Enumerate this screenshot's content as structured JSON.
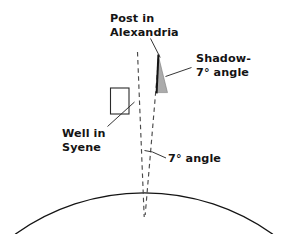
{
  "figure": {
    "title_semantic": "eratosthenes-earth-circumference-diagram",
    "background_color": "#ffffff",
    "line_color": "#141414",
    "dashed_line_color": "#555555",
    "shadow_fill_color": "#8a8a8a",
    "post_color": "#141414"
  },
  "labels": {
    "post": {
      "line1": "Post in",
      "line2": "Alexandria"
    },
    "shadow": {
      "line1": "Shadow-",
      "line2_value": "7",
      "line2_degree": "°",
      "line2_rest": " angle",
      "line2_full": "7° angle"
    },
    "well": {
      "line1": "Well in",
      "line2": "Syene"
    },
    "angle": {
      "value": "7",
      "degree": "°",
      "rest": " angle",
      "full": "7° angle"
    }
  },
  "geometry": {
    "earth_arc": {
      "center_x": 144,
      "center_y": 310,
      "radius": 221,
      "apex_y": 89
    },
    "well_rect": {
      "x": 110,
      "y": 88,
      "width": 19,
      "height": 26
    },
    "post": {
      "top_x": 158,
      "top_y": 55,
      "base_x": 156,
      "base_y": 93
    },
    "shadow_wedge": {
      "apex_x": 158,
      "apex_y": 55,
      "base_left_x": 157,
      "base_right_x": 167,
      "base_y": 93
    },
    "dashed_left": {
      "x1": 137,
      "y1": 53,
      "x2": 144,
      "y2": 216
    },
    "dashed_right": {
      "x1": 158,
      "y1": 60,
      "x2": 145,
      "y2": 214
    },
    "angle_degrees": 7
  }
}
